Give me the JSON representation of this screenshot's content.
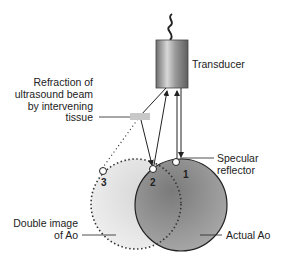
{
  "diagram": {
    "labels": {
      "transducer": "Transducer",
      "refraction": [
        "Refraction of",
        "ultrasound beam",
        "by intervening",
        "tissue"
      ],
      "specular": [
        "Specular",
        "reflector"
      ],
      "double_image": [
        "Double image",
        "of Ao"
      ],
      "actual": "Actual Ao"
    },
    "points": [
      {
        "id": "1",
        "label": "1"
      },
      {
        "id": "2",
        "label": "2"
      },
      {
        "id": "3",
        "label": "3"
      }
    ],
    "colors": {
      "actual_ao_fill": "#8f8f8f",
      "double_image_fill": "#e6e6e6",
      "stroke": "#222222",
      "transducer_body": "#8a8a8a"
    }
  }
}
